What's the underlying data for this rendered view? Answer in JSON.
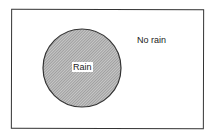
{
  "diagram": {
    "type": "venn",
    "universe_label": "No rain",
    "sets": [
      {
        "label": "Rain",
        "fill_pattern": "hatched",
        "color": "#999999"
      }
    ]
  }
}
